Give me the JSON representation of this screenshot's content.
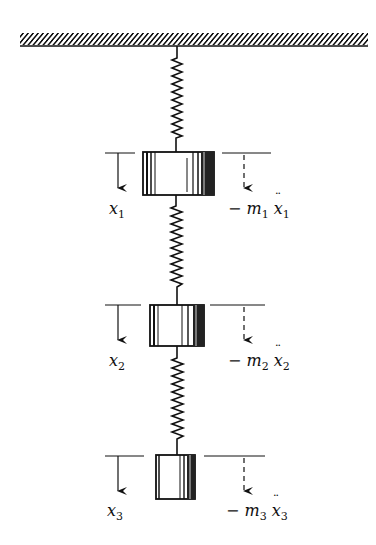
{
  "figure": {
    "colors": {
      "ink": "#111111",
      "background": "#ffffff"
    },
    "ceiling": {
      "label": ""
    },
    "masses": [
      {
        "id": "m1",
        "displacement_label": "x",
        "displacement_sub": "1",
        "inertia_prefix": "− m",
        "inertia_mass_sub": "1",
        "inertia_var": "x",
        "inertia_var_sub": "1"
      },
      {
        "id": "m2",
        "displacement_label": "x",
        "displacement_sub": "2",
        "inertia_prefix": "− m",
        "inertia_mass_sub": "2",
        "inertia_var": "x",
        "inertia_var_sub": "2"
      },
      {
        "id": "m3",
        "displacement_label": "x",
        "displacement_sub": "3",
        "inertia_prefix": "− m",
        "inertia_mass_sub": "3",
        "inertia_var": "x",
        "inertia_var_sub": "3"
      }
    ],
    "springs": [
      {
        "id": "k1",
        "from": "ceiling",
        "to": "m1"
      },
      {
        "id": "k2",
        "from": "m1",
        "to": "m2"
      },
      {
        "id": "k3",
        "from": "m2",
        "to": "m3"
      }
    ]
  }
}
